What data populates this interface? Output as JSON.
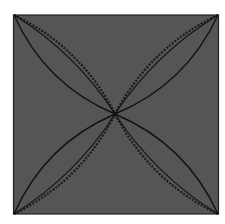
{
  "diagram": {
    "colors": {
      "background": "#ffffff",
      "square_fill": "#555555",
      "square_border": "#222222",
      "curve_solid": "#111111",
      "curve_dashed": "#1a1a1a"
    },
    "corners": [
      "top-left",
      "top-right",
      "bottom-left",
      "bottom-right"
    ],
    "curve_styles": [
      "solid",
      "dashed",
      "solid-inner"
    ]
  }
}
